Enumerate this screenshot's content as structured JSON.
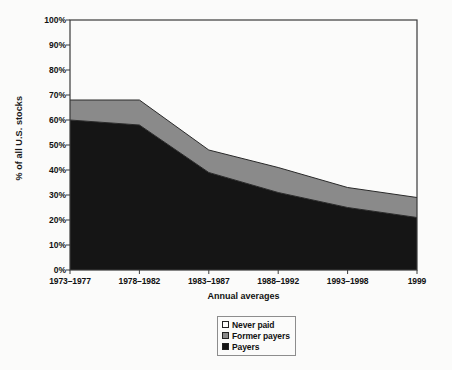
{
  "chart_data": {
    "type": "area",
    "title": "",
    "subtitle": "",
    "xlabel": "Annual averages",
    "ylabel": "% of all U.S. stocks",
    "categories": [
      "1973–1977",
      "1978–1982",
      "1983–1987",
      "1988–1992",
      "1993–1998",
      "1999"
    ],
    "stacked": true,
    "series": [
      {
        "name": "Payers",
        "color": "#151515",
        "values": [
          60,
          58,
          39,
          31,
          25,
          21
        ]
      },
      {
        "name": "Former payers",
        "color": "#8a8a8a",
        "values": [
          8,
          10,
          9,
          10,
          8,
          8
        ]
      },
      {
        "name": "Never paid",
        "color": "#fbfbfa",
        "values": [
          32,
          32,
          52,
          59,
          67,
          71
        ]
      }
    ],
    "cumulative_tops": {
      "payers": [
        60,
        58,
        39,
        31,
        25,
        21
      ],
      "former_payers": [
        68,
        68,
        48,
        41,
        33,
        29
      ],
      "never_paid": [
        100,
        100,
        100,
        100,
        100,
        100
      ]
    },
    "ylim": [
      0,
      100
    ],
    "yticks": [
      "0%",
      "10%",
      "20%",
      "30%",
      "40%",
      "50%",
      "60%",
      "70%",
      "80%",
      "90%",
      "100%"
    ],
    "ytick_values": [
      0,
      10,
      20,
      30,
      40,
      50,
      60,
      70,
      80,
      90,
      100
    ],
    "grid": false,
    "legend_position": "bottom-center",
    "legend_entries": [
      {
        "label": "Never paid",
        "color": "#fbfbfa"
      },
      {
        "label": "Former payers",
        "color": "#8a8a8a"
      },
      {
        "label": "Payers",
        "color": "#151515"
      }
    ],
    "axis_color": "#3a3a3a",
    "background": "#fbfbfa"
  }
}
